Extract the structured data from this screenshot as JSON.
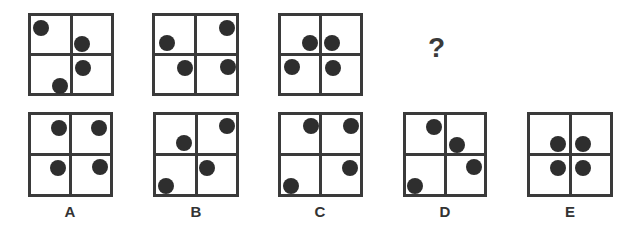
{
  "puzzle": {
    "question_mark": "?",
    "sequence": [
      {
        "box": {
          "x": 28,
          "y": 13,
          "w": 86,
          "h": 83
        },
        "dots": [
          [
            41,
            28
          ],
          [
            82,
            44
          ],
          [
            83,
            68
          ],
          [
            60,
            86
          ]
        ]
      },
      {
        "box": {
          "x": 152,
          "y": 13,
          "w": 87,
          "h": 83
        },
        "dots": [
          [
            167,
            43
          ],
          [
            227,
            28
          ],
          [
            185,
            68
          ],
          [
            228,
            67
          ]
        ]
      },
      {
        "box": {
          "x": 278,
          "y": 13,
          "w": 85,
          "h": 83
        },
        "dots": [
          [
            310,
            43
          ],
          [
            332,
            43
          ],
          [
            292,
            67
          ],
          [
            333,
            68
          ]
        ]
      }
    ],
    "options": [
      {
        "label": "A",
        "box": {
          "x": 28,
          "y": 112,
          "w": 85,
          "h": 85
        },
        "dots": [
          [
            59,
            128
          ],
          [
            99,
            128
          ],
          [
            58,
            168
          ],
          [
            100,
            167
          ]
        ]
      },
      {
        "label": "B",
        "box": {
          "x": 153,
          "y": 112,
          "w": 86,
          "h": 85
        },
        "dots": [
          [
            227,
            126
          ],
          [
            184,
            143
          ],
          [
            207,
            168
          ],
          [
            166,
            186
          ]
        ]
      },
      {
        "label": "C",
        "box": {
          "x": 278,
          "y": 112,
          "w": 85,
          "h": 85
        },
        "dots": [
          [
            311,
            126
          ],
          [
            351,
            126
          ],
          [
            350,
            168
          ],
          [
            291,
            186
          ]
        ]
      },
      {
        "label": "D",
        "box": {
          "x": 403,
          "y": 112,
          "w": 84,
          "h": 85
        },
        "dots": [
          [
            434,
            127
          ],
          [
            457,
            145
          ],
          [
            474,
            167
          ],
          [
            415,
            186
          ]
        ]
      },
      {
        "label": "E",
        "box": {
          "x": 527,
          "y": 112,
          "w": 86,
          "h": 85
        },
        "dots": [
          [
            558,
            144
          ],
          [
            583,
            144
          ],
          [
            558,
            168
          ],
          [
            583,
            168
          ]
        ]
      }
    ]
  },
  "labels": {
    "A": "A",
    "B": "B",
    "C": "C",
    "D": "D",
    "E": "E"
  }
}
